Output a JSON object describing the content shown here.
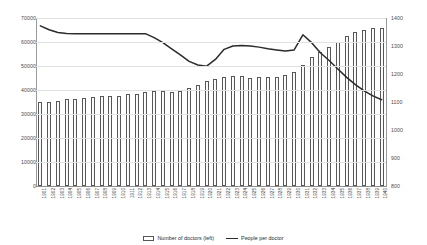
{
  "chart_data": {
    "type": "bar",
    "title": "",
    "xlabel": "",
    "ylabel": "",
    "grid": true,
    "legend_position": "bottom",
    "categories": [
      "1901",
      "1902",
      "1903",
      "1904",
      "1905",
      "1906",
      "1907",
      "1908",
      "1909",
      "1910",
      "1911",
      "1912",
      "1913",
      "1914",
      "1915",
      "1916",
      "1917",
      "1918",
      "1919",
      "1920",
      "1921",
      "1922",
      "1923",
      "1924",
      "1925",
      "1926",
      "1927",
      "1928",
      "1929",
      "1930",
      "1931",
      "1932",
      "1933",
      "1934",
      "1935",
      "1936",
      "1937",
      "1938",
      "1939",
      "1940"
    ],
    "axes": {
      "left": {
        "label": "Number of doctors (left)",
        "ticks": [
          "0",
          "10000",
          "20000",
          "30000",
          "40000",
          "50000",
          "60000",
          "70000"
        ],
        "min": 0,
        "max": 70000
      },
      "right": {
        "label": "People per doctor",
        "ticks": [
          "800",
          "900",
          "1000",
          "1100",
          "1200",
          "1300",
          "1400"
        ],
        "min": 800,
        "max": 1400
      }
    },
    "series": [
      {
        "name": "Number of doctors (left)",
        "type": "bar",
        "axis": "left",
        "values": [
          34800,
          35100,
          35400,
          36200,
          36400,
          36500,
          36900,
          37400,
          37600,
          37700,
          38200,
          38500,
          39100,
          39400,
          39600,
          39300,
          39500,
          40900,
          42200,
          43600,
          44600,
          45600,
          45700,
          46000,
          45200,
          45400,
          45500,
          45600,
          46200,
          47400,
          50400,
          53600,
          55800,
          57900,
          60200,
          62500,
          64000,
          64900,
          65800,
          66000
        ]
      },
      {
        "name": "People per doctor",
        "type": "line",
        "axis": "right",
        "values": [
          1372,
          1358,
          1348,
          1345,
          1344,
          1344,
          1344,
          1344,
          1344,
          1344,
          1344,
          1344,
          1344,
          1330,
          1312,
          1290,
          1268,
          1245,
          1232,
          1228,
          1252,
          1288,
          1300,
          1302,
          1300,
          1296,
          1290,
          1286,
          1282,
          1286,
          1340,
          1312,
          1276,
          1248,
          1218,
          1188,
          1162,
          1140,
          1122,
          1108
        ]
      }
    ],
    "colors": {
      "bar_fill": "#ffffff",
      "bar_stroke": "#575757",
      "line": "#2b2b2b",
      "grid": "#e2e2e2",
      "axis": "#9a9a9a",
      "text": "#3d3d3d"
    }
  },
  "legend": {
    "items": [
      {
        "label": "Number of doctors (left)",
        "marker": "bar-swatch-icon"
      },
      {
        "label": "People per doctor",
        "marker": "line-swatch-icon"
      }
    ]
  }
}
